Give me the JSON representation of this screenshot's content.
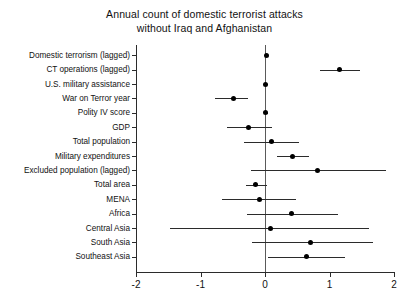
{
  "chart_data": {
    "type": "scatter",
    "subtype": "coefficient-plot",
    "title": "Annual count of domestic terrorist attacks without Iraq and Afghanistan",
    "title_lines": [
      "Annual count of domestic terrorist attacks",
      "without Iraq and Afghanistan"
    ],
    "xlabel": "",
    "ylabel": "",
    "xlim": [
      -2,
      2
    ],
    "xticks": [
      -2,
      -1,
      0,
      1,
      2
    ],
    "xtick_labels": [
      "-2",
      "-1",
      "0",
      "1",
      "2"
    ],
    "grid": false,
    "legend": false,
    "zero_reference_line": 0,
    "orientation": "horizontal",
    "categories": [
      "Domestic terrorism (lagged)",
      "CT operations (lagged)",
      "U.S. military assistance",
      "War on Terror year",
      "Polity IV score",
      "GDP",
      "Total population",
      "Military expenditures",
      "Excluded population (lagged)",
      "Total area",
      "MENA",
      "Africa",
      "Central Asia",
      "South Asia",
      "Southeast Asia"
    ],
    "points": [
      {
        "label": "Domestic terrorism (lagged)",
        "estimate": 0.02,
        "ci_low": 0.0,
        "ci_high": 0.04
      },
      {
        "label": "CT operations (lagged)",
        "estimate": 1.16,
        "ci_low": 0.85,
        "ci_high": 1.48
      },
      {
        "label": "U.S. military assistance",
        "estimate": 0.01,
        "ci_low": -0.02,
        "ci_high": 0.04
      },
      {
        "label": "War on Terror year",
        "estimate": -0.49,
        "ci_low": -0.77,
        "ci_high": -0.26
      },
      {
        "label": "Polity IV score",
        "estimate": 0.01,
        "ci_low": -0.02,
        "ci_high": 0.04
      },
      {
        "label": "GDP",
        "estimate": -0.25,
        "ci_low": -0.59,
        "ci_high": 0.11
      },
      {
        "label": "Total population",
        "estimate": 0.1,
        "ci_low": -0.33,
        "ci_high": 0.52
      },
      {
        "label": "Military expenditures",
        "estimate": 0.42,
        "ci_low": 0.18,
        "ci_high": 0.68
      },
      {
        "label": "Excluded population (lagged)",
        "estimate": 0.82,
        "ci_low": -0.22,
        "ci_high": 1.87
      },
      {
        "label": "Total area",
        "estimate": -0.15,
        "ci_low": -0.3,
        "ci_high": 0.03
      },
      {
        "label": "MENA",
        "estimate": -0.09,
        "ci_low": -0.67,
        "ci_high": 0.48
      },
      {
        "label": "Africa",
        "estimate": 0.41,
        "ci_low": -0.28,
        "ci_high": 1.13
      },
      {
        "label": "Central Asia",
        "estimate": 0.09,
        "ci_low": -1.47,
        "ci_high": 1.61
      },
      {
        "label": "South Asia",
        "estimate": 0.71,
        "ci_low": -0.2,
        "ci_high": 1.68
      },
      {
        "label": "Southeast Asia",
        "estimate": 0.64,
        "ci_low": 0.05,
        "ci_high": 1.24
      }
    ],
    "values": [
      0.02,
      1.16,
      0.01,
      -0.49,
      0.01,
      -0.25,
      0.1,
      0.42,
      0.82,
      -0.15,
      -0.09,
      0.41,
      0.09,
      0.71,
      0.64
    ],
    "colors": {
      "point": "#000000",
      "interval": "#2b2b2b",
      "axis": "#2b2b2b",
      "zero_line": "#5a5a5a",
      "background": "#ffffff",
      "text": "#111111"
    }
  }
}
